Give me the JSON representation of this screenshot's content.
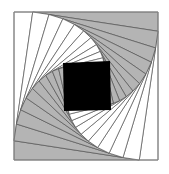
{
  "diagram": {
    "type": "nested-rotating-squares-spiral",
    "outer_square": [
      [
        14,
        12
      ],
      [
        158,
        12
      ],
      [
        158,
        160
      ],
      [
        14,
        160
      ]
    ],
    "step_fraction": 0.13,
    "steps": 10,
    "colors": {
      "background": "#ffffff",
      "gray_fill": "#b4b4b4",
      "white_fill": "#ffffff",
      "line": "#555555",
      "outer_border": "#888888",
      "center": "#000000"
    },
    "center_square": [
      [
        63,
        63
      ],
      [
        110,
        61
      ],
      [
        111,
        110
      ],
      [
        64,
        111
      ]
    ]
  }
}
